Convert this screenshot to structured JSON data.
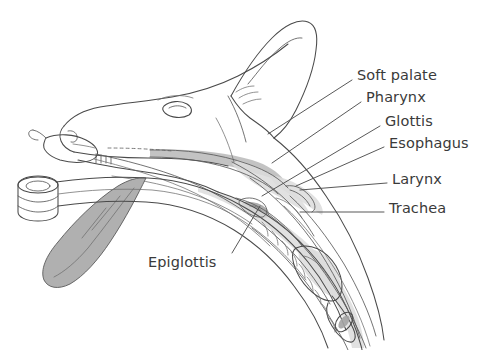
{
  "figure": {
    "background_color": "#ffffff",
    "ink_color": "#4a4a4a",
    "label_color": "#3a3a3a",
    "shade_color": "#bdbdbd"
  },
  "labels": [
    {
      "id": "soft-palate",
      "text": "Soft palate",
      "x": 357,
      "y": 68,
      "leader": {
        "x1": 352,
        "y1": 80,
        "x2": 268,
        "y2": 134
      }
    },
    {
      "id": "pharynx",
      "text": "Pharynx",
      "x": 366,
      "y": 90,
      "leader": {
        "x1": 361,
        "y1": 102,
        "x2": 272,
        "y2": 163
      }
    },
    {
      "id": "glottis",
      "text": "Glottis",
      "x": 385,
      "y": 114,
      "leader": {
        "x1": 380,
        "y1": 126,
        "x2": 262,
        "y2": 196
      }
    },
    {
      "id": "esophagus",
      "text": "Esophagus",
      "x": 389,
      "y": 136,
      "leader": {
        "x1": 384,
        "y1": 147,
        "x2": 296,
        "y2": 186
      }
    },
    {
      "id": "larynx",
      "text": "Larynx",
      "x": 392,
      "y": 172,
      "leader": {
        "x1": 387,
        "y1": 183,
        "x2": 300,
        "y2": 190
      }
    },
    {
      "id": "trachea",
      "text": "Trachea",
      "x": 389,
      "y": 201,
      "leader": {
        "x1": 384,
        "y1": 212,
        "x2": 300,
        "y2": 212
      }
    },
    {
      "id": "epiglottis",
      "text": "Epiglottis",
      "x": 148,
      "y": 255,
      "leader": {
        "x1": 232,
        "y1": 253,
        "x2": 260,
        "y2": 206
      }
    }
  ],
  "anatomy_parts": [
    "nose",
    "muzzle",
    "eye",
    "ear",
    "tongue",
    "hard-palate",
    "soft-palate",
    "pharynx",
    "epiglottis",
    "glottis",
    "larynx",
    "esophagus",
    "trachea",
    "tracheal-rings"
  ],
  "equipment_parts": [
    "endotracheal-tube",
    "tube-connector",
    "pilot-balloon",
    "inflation-line",
    "tracheal-cuff"
  ]
}
